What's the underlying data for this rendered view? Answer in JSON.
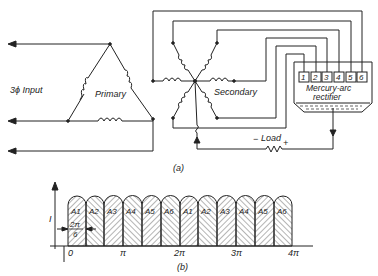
{
  "circuit": {
    "input_label": "3ϕ Input",
    "primary_label": "Primary",
    "secondary_label": "Secondary",
    "rectifier_label_1": "Mercury-arc",
    "rectifier_label_2": "rectifier",
    "anodes": [
      "1",
      "2",
      "3",
      "4",
      "5",
      "6"
    ],
    "load_label": "Load",
    "load_minus": "−",
    "load_plus": "+",
    "caption": "(a)"
  },
  "waveform": {
    "y_label": "I",
    "pulses": [
      "A1",
      "A2",
      "A3",
      "A4",
      "A5",
      "A6",
      "A1",
      "A2",
      "A3",
      "A4",
      "A5",
      "A6"
    ],
    "interval_num": "2π",
    "interval_den": "6",
    "x_ticks": [
      "0",
      "π",
      "2π",
      "3π",
      "4π"
    ],
    "caption": "(b)"
  }
}
